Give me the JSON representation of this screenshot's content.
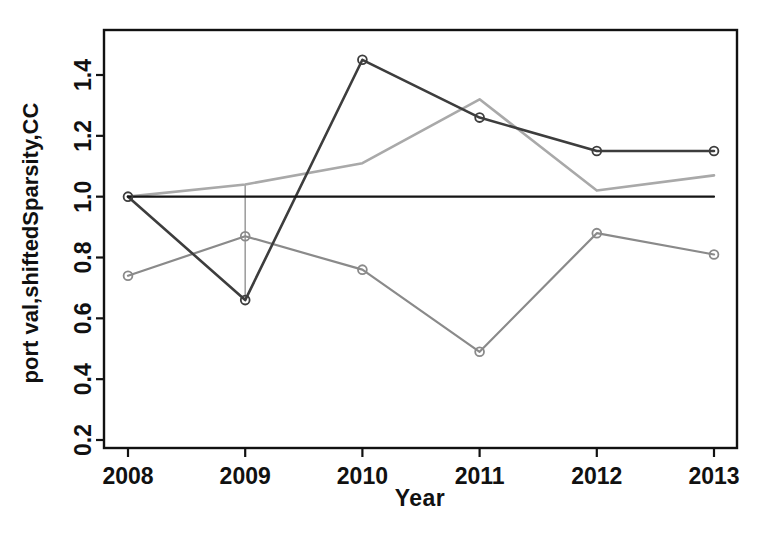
{
  "figure": {
    "background": "#ffffff",
    "axis_color": "#111111"
  },
  "chart_data": {
    "type": "line",
    "title": "",
    "xlabel": "Year",
    "ylabel": "port val,shiftedSparsity,CC",
    "x": [
      2008,
      2009,
      2010,
      2011,
      2012,
      2013
    ],
    "xtick_labels": [
      "2008",
      "2009",
      "2010",
      "2011",
      "2012",
      "2013"
    ],
    "yticks": [
      0.2,
      0.4,
      0.6,
      0.8,
      1.0,
      1.2,
      1.4
    ],
    "ytick_labels": [
      "0.2",
      "0.4",
      "0.6",
      "0.8",
      "1.0",
      "1.2",
      "1.4"
    ],
    "xlim": [
      2007.8,
      2013.2
    ],
    "ylim": [
      0.17,
      1.55
    ],
    "grid": false,
    "legend": "none",
    "marker_style": "open-circle",
    "series": [
      {
        "name": "shifted-sparsity-light-gray-line",
        "values": [
          1.0,
          1.04,
          1.11,
          1.32,
          1.02,
          1.07
        ],
        "color": "#a9a9a9",
        "markers": false,
        "line_width": 2.6
      },
      {
        "name": "gray-marker-line",
        "values": [
          0.74,
          0.87,
          0.76,
          0.49,
          0.88,
          0.81
        ],
        "color": "#8a8a8a",
        "markers": true,
        "line_width": 2.2
      },
      {
        "name": "port-val-dark-line",
        "values": [
          1.0,
          0.66,
          1.45,
          1.26,
          1.15,
          1.15
        ],
        "color": "#3d3d3d",
        "markers": true,
        "line_width": 2.6
      },
      {
        "name": "cc-baseline",
        "values": [
          1.0,
          1.0,
          1.0,
          1.0,
          1.0,
          1.0
        ],
        "color": "#151515",
        "markers": false,
        "line_width": 2.2
      }
    ],
    "annotations": [
      {
        "type": "vertical-segment",
        "x": 2009,
        "y_from": 1.04,
        "y_to": 0.66,
        "color": "#a0a0a0",
        "line_width": 1.6
      }
    ]
  }
}
